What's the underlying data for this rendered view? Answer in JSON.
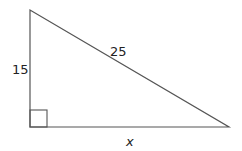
{
  "diagram": {
    "type": "right-triangle",
    "vertices": {
      "top": [
        30,
        10
      ],
      "right_angle": [
        30,
        127
      ],
      "bottom_right": [
        229,
        127
      ]
    },
    "right_angle_marker_size": 17,
    "line_color": "#555555",
    "labels": {
      "vertical_leg": "15",
      "hypotenuse": "25",
      "horizontal_leg": "x"
    }
  }
}
